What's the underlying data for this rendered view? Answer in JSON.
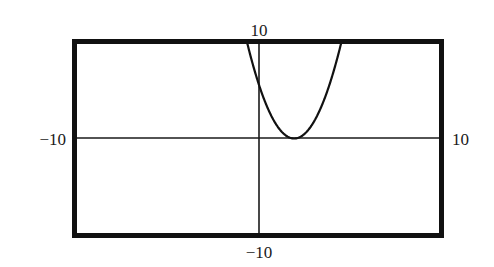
{
  "chart_data": {
    "type": "line",
    "title": "",
    "xlabel": "",
    "ylabel": "",
    "xlim": [
      -10,
      10
    ],
    "ylim": [
      -10,
      10
    ],
    "grid": false,
    "legend": null,
    "window_labels": {
      "xmin": "−10",
      "xmax": "10",
      "ymin": "−10",
      "ymax": "10"
    },
    "series": [
      {
        "name": "parabola",
        "equation": "y = 1.5(x - 2)^2",
        "vertex": [
          2,
          0
        ],
        "y_intercept": 6,
        "x": [
          -0.58,
          -0.5,
          0,
          0.5,
          1,
          1.5,
          2,
          2.5,
          3,
          3.5,
          4,
          4.5,
          4.58
        ],
        "values": [
          10,
          9.38,
          6,
          3.38,
          1.5,
          0.38,
          0,
          0.38,
          1.5,
          3.38,
          6,
          9.38,
          10
        ]
      }
    ],
    "colors": {
      "frame": "#111111",
      "axes": "#1a1a1a",
      "curve": "#111111",
      "background": "#ffffff"
    }
  }
}
